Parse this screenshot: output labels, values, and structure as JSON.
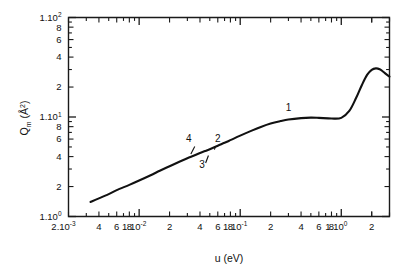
{
  "figure": {
    "background_color": "#ffffff",
    "line_color": "#111111",
    "axis_color": "#1a1a1a"
  },
  "axes": {
    "x_title_main": "u",
    "x_title_unit": "(eV)",
    "x_title_full": "u (eV)",
    "y_title_symbol": "Q",
    "y_title_subscript": "m",
    "y_title_unit": "(Å",
    "y_title_unit_sup": "2",
    "y_title_unit_close": ")",
    "y_title_full": "Qm (Å2)"
  },
  "x_tick_labels": [
    {
      "mantissa": "2.10",
      "exponent": "-3",
      "value": 0.002
    },
    {
      "mantissa": "4",
      "exponent": "",
      "value": 0.004
    },
    {
      "mantissa": "6",
      "exponent": "",
      "value": 0.006
    },
    {
      "mantissa": "8",
      "exponent": "",
      "value": 0.008
    },
    {
      "mantissa": "1.10",
      "exponent": "-2",
      "value": 0.01
    },
    {
      "mantissa": "2",
      "exponent": "",
      "value": 0.02
    },
    {
      "mantissa": "4",
      "exponent": "",
      "value": 0.04
    },
    {
      "mantissa": "6",
      "exponent": "",
      "value": 0.06
    },
    {
      "mantissa": "8",
      "exponent": "",
      "value": 0.08
    },
    {
      "mantissa": "1.10",
      "exponent": "-1",
      "value": 0.1
    },
    {
      "mantissa": "2",
      "exponent": "",
      "value": 0.2
    },
    {
      "mantissa": "4",
      "exponent": "",
      "value": 0.4
    },
    {
      "mantissa": "6",
      "exponent": "",
      "value": 0.6
    },
    {
      "mantissa": "8",
      "exponent": "",
      "value": 0.8
    },
    {
      "mantissa": "1.10",
      "exponent": "0",
      "value": 1.0
    },
    {
      "mantissa": "2",
      "exponent": "",
      "value": 2.0
    }
  ],
  "y_tick_labels": [
    {
      "mantissa": "1.10",
      "exponent": "0",
      "value": 1
    },
    {
      "mantissa": "2",
      "exponent": "",
      "value": 2
    },
    {
      "mantissa": "4",
      "exponent": "",
      "value": 4
    },
    {
      "mantissa": "6",
      "exponent": "",
      "value": 6
    },
    {
      "mantissa": "8",
      "exponent": "",
      "value": 8
    },
    {
      "mantissa": "1.10",
      "exponent": "1",
      "value": 10
    },
    {
      "mantissa": "2",
      "exponent": "",
      "value": 20
    },
    {
      "mantissa": "4",
      "exponent": "",
      "value": 40
    },
    {
      "mantissa": "6",
      "exponent": "",
      "value": 60
    },
    {
      "mantissa": "8",
      "exponent": "",
      "value": 80
    },
    {
      "mantissa": "1.10",
      "exponent": "2",
      "value": 100
    }
  ],
  "curve_labels": [
    {
      "text": "1",
      "x": 0.3,
      "y": 11.6
    },
    {
      "text": "2",
      "x": 0.06,
      "y": 5.6
    },
    {
      "text": "3",
      "x": 0.042,
      "y": 3.1
    },
    {
      "text": "4",
      "x": 0.031,
      "y": 5.6
    }
  ],
  "chart_data": {
    "type": "line",
    "title": "",
    "xlabel": "u (eV)",
    "ylabel": "Qm (Å2)",
    "xscale": "log",
    "yscale": "log",
    "xlim": [
      0.002,
      3.0
    ],
    "ylim": [
      1,
      100
    ],
    "grid": false,
    "legend": null,
    "series": [
      {
        "name": "1",
        "x": [
          0.0033,
          0.004,
          0.005,
          0.006,
          0.008,
          0.01,
          0.013,
          0.016,
          0.02,
          0.025,
          0.03,
          0.035,
          0.04,
          0.045,
          0.05,
          0.06,
          0.07,
          0.08,
          0.1,
          0.13,
          0.16,
          0.2,
          0.25,
          0.3,
          0.4,
          0.5,
          0.6,
          0.8,
          1.0,
          1.2,
          1.4,
          1.6,
          1.8,
          2.0,
          2.2,
          2.4,
          2.6,
          2.8,
          3.0
        ],
        "y": [
          1.4,
          1.52,
          1.68,
          1.84,
          2.08,
          2.3,
          2.6,
          2.88,
          3.2,
          3.55,
          3.85,
          4.1,
          4.35,
          4.55,
          4.75,
          5.15,
          5.5,
          5.85,
          6.5,
          7.3,
          7.95,
          8.6,
          9.1,
          9.45,
          9.75,
          9.85,
          9.8,
          9.65,
          9.8,
          11.5,
          15.5,
          21.0,
          26.5,
          29.8,
          30.8,
          30.2,
          28.5,
          26.8,
          25.5
        ]
      }
    ],
    "annotations": [
      {
        "label": "1",
        "note": "main curve label on upper segment"
      },
      {
        "label": "2",
        "note": "pointer to curve near 0.055 eV"
      },
      {
        "label": "3",
        "note": "pointer to curve near 0.045 eV from below"
      },
      {
        "label": "4",
        "note": "pointer to curve near 0.038 eV from above"
      }
    ]
  }
}
